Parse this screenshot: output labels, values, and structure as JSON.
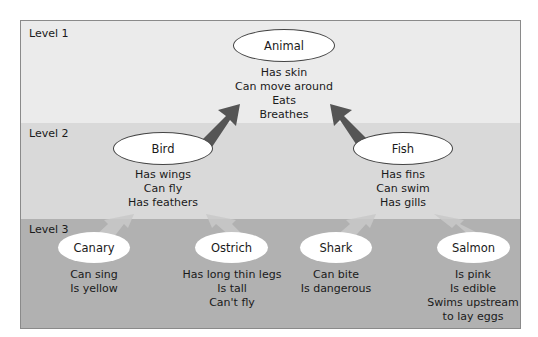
{
  "levels": [
    {
      "label": "Level 1"
    },
    {
      "label": "Level 2"
    },
    {
      "label": "Level 3"
    }
  ],
  "colors": {
    "level1_bg": "#ebebeb",
    "level2_bg": "#d9d9d9",
    "level3_bg": "#b1b1b1",
    "dark_arrow": "#555555",
    "light_arrow": "#c9c9c9",
    "node_fill": "#ffffff"
  },
  "nodes": {
    "animal": {
      "label": "Animal",
      "properties": [
        "Has skin",
        "Can move around",
        "Eats",
        "Breathes"
      ]
    },
    "bird": {
      "label": "Bird",
      "properties": [
        "Has wings",
        "Can fly",
        "Has feathers"
      ]
    },
    "fish": {
      "label": "Fish",
      "properties": [
        "Has fins",
        "Can swim",
        "Has gills"
      ]
    },
    "canary": {
      "label": "Canary",
      "properties": [
        "Can sing",
        "Is yellow"
      ]
    },
    "ostrich": {
      "label": "Ostrich",
      "properties": [
        "Has long thin legs",
        "Is tall",
        "Can't fly"
      ]
    },
    "shark": {
      "label": "Shark",
      "properties": [
        "Can bite",
        "Is dangerous"
      ]
    },
    "salmon": {
      "label": "Salmon",
      "properties": [
        "Is pink",
        "Is edible",
        "Swims upstream",
        "to lay eggs"
      ]
    }
  },
  "edges": [
    {
      "from": "bird",
      "to": "animal"
    },
    {
      "from": "fish",
      "to": "animal"
    },
    {
      "from": "canary",
      "to": "bird"
    },
    {
      "from": "ostrich",
      "to": "bird"
    },
    {
      "from": "shark",
      "to": "fish"
    },
    {
      "from": "salmon",
      "to": "fish"
    }
  ]
}
